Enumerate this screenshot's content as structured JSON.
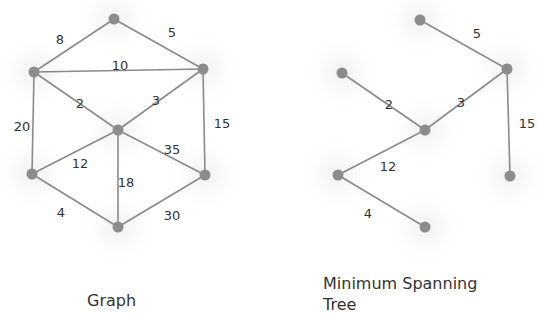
{
  "graph": {
    "caption": "Graph",
    "nodes": [
      {
        "id": "A",
        "x": 114,
        "y": 19
      },
      {
        "id": "B",
        "x": 34,
        "y": 72
      },
      {
        "id": "C",
        "x": 203,
        "y": 69
      },
      {
        "id": "D",
        "x": 118,
        "y": 130
      },
      {
        "id": "E",
        "x": 32,
        "y": 174
      },
      {
        "id": "F",
        "x": 205,
        "y": 175
      },
      {
        "id": "G",
        "x": 118,
        "y": 227
      }
    ],
    "edges": [
      {
        "from": "A",
        "to": "B",
        "weight": "8",
        "lx": 60,
        "ly": 40
      },
      {
        "from": "A",
        "to": "C",
        "weight": "5",
        "lx": 172,
        "ly": 33
      },
      {
        "from": "B",
        "to": "C",
        "weight": "10",
        "lx": 120,
        "ly": 66
      },
      {
        "from": "B",
        "to": "D",
        "weight": "2",
        "lx": 80,
        "ly": 104
      },
      {
        "from": "C",
        "to": "D",
        "weight": "3",
        "lx": 156,
        "ly": 101
      },
      {
        "from": "B",
        "to": "E",
        "weight": "20",
        "lx": 22,
        "ly": 127
      },
      {
        "from": "C",
        "to": "F",
        "weight": "15",
        "lx": 222,
        "ly": 124
      },
      {
        "from": "D",
        "to": "E",
        "weight": "12",
        "lx": 80,
        "ly": 164
      },
      {
        "from": "D",
        "to": "F",
        "weight": "35",
        "lx": 172,
        "ly": 150
      },
      {
        "from": "D",
        "to": "G",
        "weight": "18",
        "lx": 126,
        "ly": 183
      },
      {
        "from": "E",
        "to": "G",
        "weight": "4",
        "lx": 61,
        "ly": 213
      },
      {
        "from": "F",
        "to": "G",
        "weight": "30",
        "lx": 172,
        "ly": 216
      }
    ]
  },
  "mst": {
    "caption_line1": "Minimum Spanning",
    "caption_line2": "Tree",
    "nodes": [
      {
        "id": "A",
        "x": 420,
        "y": 20
      },
      {
        "id": "B",
        "x": 342,
        "y": 73
      },
      {
        "id": "C",
        "x": 507,
        "y": 69
      },
      {
        "id": "D",
        "x": 425,
        "y": 130
      },
      {
        "id": "E",
        "x": 338,
        "y": 175
      },
      {
        "id": "F",
        "x": 510,
        "y": 176
      },
      {
        "id": "G",
        "x": 425,
        "y": 227
      }
    ],
    "edges": [
      {
        "from": "A",
        "to": "C",
        "weight": "5",
        "lx": 477,
        "ly": 34
      },
      {
        "from": "B",
        "to": "D",
        "weight": "2",
        "lx": 389,
        "ly": 105
      },
      {
        "from": "C",
        "to": "D",
        "weight": "3",
        "lx": 461,
        "ly": 103
      },
      {
        "from": "C",
        "to": "F",
        "weight": "15",
        "lx": 527,
        "ly": 124
      },
      {
        "from": "D",
        "to": "E",
        "weight": "12",
        "lx": 388,
        "ly": 167
      },
      {
        "from": "E",
        "to": "G",
        "weight": "4",
        "lx": 368,
        "ly": 214
      }
    ]
  }
}
